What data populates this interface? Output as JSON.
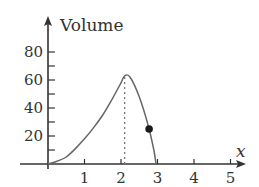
{
  "chart_data": {
    "type": "line",
    "title": "",
    "xlabel": "x",
    "ylabel": "Volume",
    "xlim": [
      -0.75,
      5.4
    ],
    "ylim": [
      0,
      95
    ],
    "x_ticks": [
      1,
      2,
      3,
      4,
      5
    ],
    "x_tick_labels": [
      "1",
      "2",
      "3",
      "4",
      "5"
    ],
    "y_ticks": [
      10,
      20,
      30,
      40,
      50,
      60,
      70,
      80
    ],
    "y_tick_labels": [
      "20",
      "40",
      "60",
      "80"
    ],
    "y_labeled_values": [
      20,
      40,
      60,
      80
    ],
    "grid": false,
    "legend": null,
    "series": [
      {
        "name": "Volume",
        "x": [
          0,
          0.25,
          0.5,
          0.75,
          1.0,
          1.25,
          1.5,
          1.75,
          2.0,
          2.1,
          2.25,
          2.5,
          2.75,
          2.9,
          2.96
        ],
        "y": [
          0,
          2,
          5,
          11,
          18,
          26,
          35,
          46,
          58,
          63,
          62,
          48,
          27,
          10,
          0
        ]
      }
    ],
    "annotations": [
      {
        "type": "dashed-vertical",
        "x": 2.1,
        "y_from": 0,
        "y_to": 63,
        "meaning": "maximum"
      },
      {
        "type": "point",
        "x": 2.77,
        "y": 25
      }
    ]
  },
  "labels": {
    "y_axis_title": "Volume",
    "x_axis_title": "x"
  },
  "colors": {
    "axis": "#333333",
    "curve": "#666666",
    "dot": "#1a1a1a",
    "dashed": "#777777"
  }
}
